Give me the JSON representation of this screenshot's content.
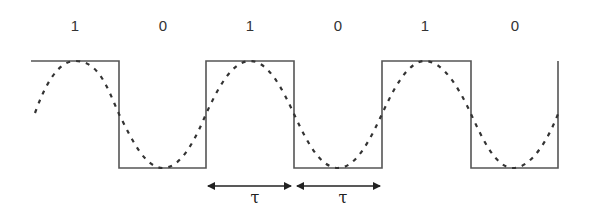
{
  "diagram": {
    "title": "",
    "bits": [
      "1",
      "0",
      "1",
      "0",
      "1",
      "0"
    ],
    "bit_positions_x": [
      75,
      163,
      250,
      338,
      425,
      515
    ],
    "square_wave": {
      "label": "digital signal",
      "high_y": 61,
      "low_y": 168,
      "points": [
        [
          31,
          61
        ],
        [
          119,
          61
        ],
        [
          119,
          168
        ],
        [
          206,
          168
        ],
        [
          206,
          61
        ],
        [
          294,
          61
        ],
        [
          294,
          168
        ],
        [
          382,
          168
        ],
        [
          382,
          61
        ],
        [
          471,
          61
        ],
        [
          471,
          168
        ],
        [
          558,
          168
        ],
        [
          558,
          61
        ]
      ],
      "color": "#444444"
    },
    "sine_wave": {
      "label": "analog approximation",
      "style": "dashed",
      "peaks_x": [
        75,
        250,
        425
      ],
      "troughs_x": [
        163,
        338,
        513
      ],
      "color": "#333333"
    },
    "intervals": [
      {
        "label": "τ",
        "x1": 207,
        "x2": 292,
        "y": 186
      },
      {
        "label": "τ",
        "x1": 296,
        "x2": 381,
        "y": 186
      }
    ]
  }
}
